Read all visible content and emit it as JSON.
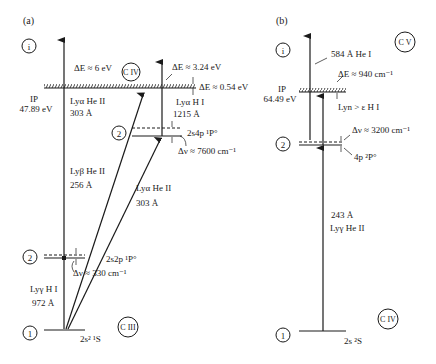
{
  "panel_a": {
    "label": "(a)",
    "ion_label_top": "C IV",
    "ion_label_bottom": "C III",
    "level_i": "i",
    "level_2_upper": "2",
    "level_2_lower": "2",
    "level_1": "1",
    "ip_label": "IP",
    "ip_value": "47.89 eV",
    "delta_e_6": "ΔE ≈ 6 eV",
    "delta_e_324": "ΔE ≈ 3.24 eV",
    "delta_e_054": "ΔE ≈ 0.54 eV",
    "ly_alpha_h": "Lyα H I",
    "ly_alpha_h_wl": "1215 Å",
    "ly_alpha_he_top": "Lyα He II",
    "ly_alpha_he_top_wl": "303 Å",
    "ly_beta_he": "Lyβ He II",
    "ly_beta_he_wl": "256 Å",
    "ly_alpha_he_diag": "Lyα He II",
    "ly_alpha_he_diag_wl": "303 Å",
    "state_2s4p": "2s4p ¹P°",
    "dnu_7600": "Δν ≈ 7600 cm⁻¹",
    "state_2s2p": "2s2p ¹P°",
    "dnu_330": "Δν ≈ 330 cm⁻¹",
    "ly_gamma_h": "Lyγ H I",
    "ly_gamma_h_wl": "972 Å",
    "ground_state": "2s² ¹S"
  },
  "panel_b": {
    "label": "(b)",
    "ion_label_top": "C V",
    "ion_label_bottom": "C IV",
    "level_i": "i",
    "level_2": "2",
    "level_1": "1",
    "ip_label": "IP",
    "ip_value": "64.49 eV",
    "he_i_line": "584 Å  He I",
    "delta_e_940": "ΔE ≈ 940 cm⁻¹",
    "ly_n_h": "Lyn > ε H I",
    "dnu_3200": "Δν ≈ 3200 cm⁻¹",
    "state_4p": "4p ²P°",
    "ly_gamma_he_wl": "243 Å",
    "ly_gamma_he": "Lyγ He II",
    "ground_state": "2s ²S"
  }
}
